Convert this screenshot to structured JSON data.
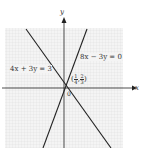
{
  "diagram": {
    "axes": {
      "x_label": "x",
      "y_label": "y",
      "origin_label": "0"
    },
    "lines": [
      {
        "equation": "4x + 3y = 3"
      },
      {
        "equation": "8x − 3y = 0"
      }
    ],
    "intersection": {
      "label_open": "(",
      "x_num": "1",
      "x_den": "4",
      "sep": ",",
      "y_num": "2",
      "y_den": "3",
      "label_close": ")"
    },
    "colors": {
      "grid": "#e4e4e4",
      "grid_bg": "#f2f2f2",
      "lines": "#222222"
    }
  }
}
